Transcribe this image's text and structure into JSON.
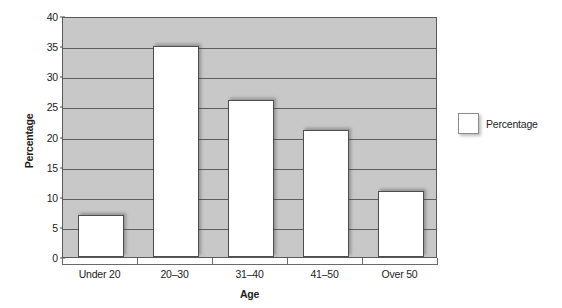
{
  "chart_data": {
    "type": "bar",
    "title": "",
    "categories": [
      "Under 20",
      "20–30",
      "31–40",
      "41–50",
      "Over 50"
    ],
    "values": [
      7,
      35,
      26,
      21,
      11
    ],
    "series": [
      {
        "name": "Percentage",
        "values": [
          7,
          35,
          26,
          21,
          11
        ]
      }
    ],
    "xlabel": "Age",
    "ylabel": "Percentage",
    "ylim": [
      0,
      40
    ],
    "ytick_step": 5,
    "yticks": [
      0,
      5,
      10,
      15,
      20,
      25,
      30,
      35,
      40
    ],
    "ytick_labels": [
      "0",
      "5",
      "10",
      "15",
      "20",
      "25",
      "30",
      "35",
      "40"
    ],
    "grid": true,
    "grid_axis": "y",
    "legend": [
      "Percentage"
    ],
    "legend_position": "right",
    "annotations": []
  },
  "colors": {
    "plot_background": "#c8c8c8",
    "bar_fill": "#ffffff",
    "bar_border": "#4e4e4e",
    "gridline": "#5e5e5e",
    "axis": "#5a5a5a",
    "text": "#1d1d1d",
    "page_background": "#ffffff"
  }
}
